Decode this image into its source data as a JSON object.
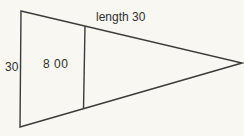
{
  "diagram": {
    "type": "geometry-pennant-triangle",
    "labels": {
      "length_top": "length 30",
      "height_left": "30",
      "inner_value": "8 00"
    },
    "shape": {
      "outline_points": "21,11 242,63 20,127",
      "divider_points": "85,26 83.5,109"
    },
    "colors": {
      "line": "#3b3b3b",
      "background": "#f8f7f1",
      "text": "#2f2f2f"
    }
  }
}
